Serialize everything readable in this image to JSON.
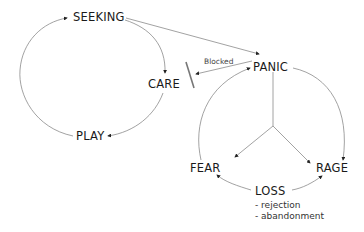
{
  "nodes": {
    "seeking": "SEEKING",
    "care": "CARE",
    "play": "PLAY",
    "panic": "PANIC",
    "fear": "FEAR",
    "rage": "RAGE",
    "loss": "LOSS"
  },
  "edge_labels": {
    "blocked": "Blocked"
  },
  "loss_items": [
    "- rejection",
    "- abandonment"
  ],
  "colors": {
    "line": "#8a8a8a",
    "arrow": "#222222",
    "blocker": "#777777",
    "text": "#1a1a1a"
  }
}
